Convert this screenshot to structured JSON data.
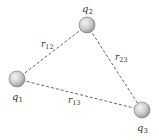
{
  "diagram": {
    "charges": [
      {
        "id": "q1",
        "name": "q",
        "sub": "1",
        "cx": 17,
        "cy": 79
      },
      {
        "id": "q2",
        "name": "q",
        "sub": "2",
        "cx": 87,
        "cy": 25
      },
      {
        "id": "q3",
        "name": "q",
        "sub": "3",
        "cx": 142,
        "cy": 110
      }
    ],
    "distances": [
      {
        "id": "r12",
        "name": "r",
        "sub": "12"
      },
      {
        "id": "r23",
        "name": "r",
        "sub": "23"
      },
      {
        "id": "r13",
        "name": "r",
        "sub": "13"
      }
    ],
    "colors": {
      "line": "#555555",
      "sphere_light": "#f4f4f4",
      "sphere_dark": "#9a9a9a"
    }
  }
}
